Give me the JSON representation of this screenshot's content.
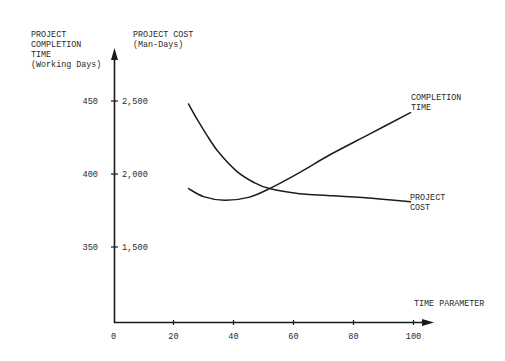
{
  "chart_data": {
    "type": "line",
    "title": "",
    "xlabel": "TIME PARAMETER",
    "ylabel_left": [
      "PROJECT",
      "COMPLETION",
      "TIME",
      "(Working Days)"
    ],
    "ylabel_right": [
      "PROJECT COST",
      "(Man-Days)"
    ],
    "x_ticks": [
      0,
      20,
      40,
      60,
      80,
      100
    ],
    "y_ticks_left": [
      350,
      400,
      450
    ],
    "y_ticks_right": [
      "1,500",
      "2,000",
      "2,500"
    ],
    "xlim": [
      0,
      107
    ],
    "ylim_left": [
      310,
      470
    ],
    "ylim_right": [
      1100,
      2700
    ],
    "grid": false,
    "legend": "inline labels at right ends of curves",
    "series": [
      {
        "name": "COMPLETION TIME",
        "label_lines": [
          "COMPLETION",
          "TIME"
        ],
        "axis": "left",
        "x": [
          25,
          30,
          37,
          45,
          52,
          62,
          72,
          85,
          99
        ],
        "values": [
          390,
          384.5,
          382,
          384,
          390,
          401,
          413,
          427,
          442
        ]
      },
      {
        "name": "PROJECT COST",
        "label_lines": [
          "PROJECT",
          "COST"
        ],
        "axis": "right",
        "x": [
          25,
          28,
          31,
          35,
          41,
          47,
          52,
          62,
          70,
          85,
          99
        ],
        "values": [
          2480,
          2370,
          2270,
          2150,
          2020,
          1940,
          1900,
          1865,
          1855,
          1835,
          1810
        ]
      }
    ]
  }
}
